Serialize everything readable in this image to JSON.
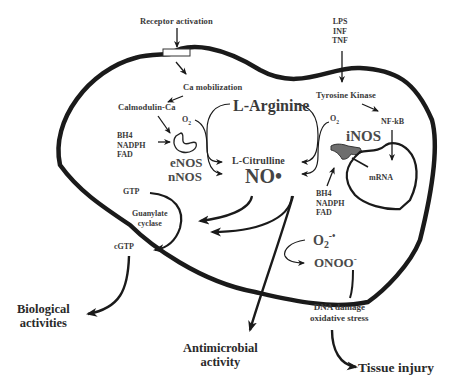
{
  "figure": {
    "colors": {
      "line": "#1a1a1a",
      "text": "#2a2a2a",
      "inos_fill": "#6e6e6e",
      "background": "#ffffff"
    }
  },
  "labels": {
    "receptor_activation": "Receptor activation",
    "ca_mobilization": "Ca mobilization",
    "calmodulin_ca": "Calmodulin-Ca",
    "cofactors_left": [
      "BH4",
      "NADPH",
      "FAD"
    ],
    "o2_left": "O",
    "o2_left_sub": "2",
    "enos": "eNOS",
    "nnos": "nNOS",
    "l_arginine": "L-Arginine",
    "l_citrulline": "L-Citrulline",
    "no_radical": "NO•",
    "o2_right": "O",
    "o2_right_sub": "2",
    "inos": "iNOS",
    "stimuli": [
      "LPS",
      "INF",
      "TNF"
    ],
    "tyrosine_kinase": "Tyrosine Kinase",
    "nf_kb": "NF-kB",
    "mrna": "mRNA",
    "cofactors_right": [
      "BH4",
      "NADPH",
      "FAD"
    ],
    "gtp": "GTP",
    "guanylate_cyclase": [
      "Guanylate",
      "cyclase"
    ],
    "cgtp": "cGTP",
    "superoxide": "O",
    "superoxide_sub": "2",
    "superoxide_sup": "-•",
    "peroxynitrite": "ONOO",
    "peroxynitrite_sup": "-",
    "dna_damage": [
      "DNA damage",
      "oxidative stress"
    ],
    "biological_activities": [
      "Biological",
      "activities"
    ],
    "antimicrobial_activity": [
      "Antimicrobial",
      "activity"
    ],
    "tissue_injury": "Tissue injury"
  }
}
